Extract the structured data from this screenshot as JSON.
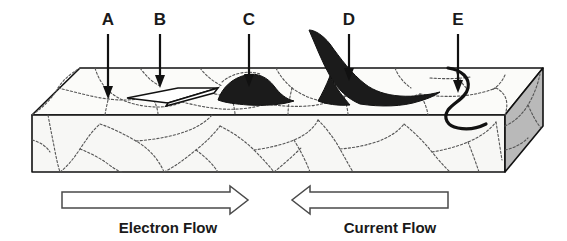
{
  "figure": {
    "title": "Metal slab cross-section with labeled defects and flow directions",
    "colors": {
      "ink": "#111111",
      "grain_boundary": "#555555",
      "top_face": "#fbfbf9",
      "front_face": "#f7f7f5",
      "side_face": "#b9b9b9",
      "defect_dark": "#1b1b1b",
      "defect_white": "#ffffff",
      "flow_arrow_outline": "#4a4a4a"
    }
  },
  "callouts": [
    {
      "id": "a",
      "label": "A",
      "label_x": 108,
      "label_y": 24,
      "arrow_x": 108,
      "arrow_top": 34,
      "arrow_bottom": 98
    },
    {
      "id": "b",
      "label": "B",
      "label_x": 160,
      "label_y": 24,
      "arrow_x": 160,
      "arrow_top": 34,
      "arrow_bottom": 84
    },
    {
      "id": "c",
      "label": "C",
      "label_x": 249,
      "label_y": 24,
      "arrow_x": 249,
      "arrow_top": 34,
      "arrow_bottom": 84
    },
    {
      "id": "d",
      "label": "D",
      "label_x": 349,
      "label_y": 24,
      "arrow_x": 349,
      "arrow_top": 34,
      "arrow_bottom": 80
    },
    {
      "id": "e",
      "label": "E",
      "label_x": 458,
      "label_y": 24,
      "arrow_x": 458,
      "arrow_top": 34,
      "arrow_bottom": 90
    }
  ],
  "flows": [
    {
      "id": "electron",
      "label": "Electron Flow",
      "label_x": 168,
      "label_y": 232,
      "direction": "right"
    },
    {
      "id": "current",
      "label": "Current Flow",
      "label_x": 390,
      "label_y": 232,
      "direction": "left"
    }
  ],
  "defects": [
    {
      "id": "a",
      "kind": "grain-interior",
      "description": "grain interior region"
    },
    {
      "id": "b",
      "kind": "white-facet",
      "description": "flat white facet / surface pit"
    },
    {
      "id": "c",
      "kind": "dark-mound",
      "description": "dark rounded deposit on surface"
    },
    {
      "id": "d",
      "kind": "dark-spike",
      "description": "dark flame-shaped whisker protrusion"
    },
    {
      "id": "e",
      "kind": "crack",
      "description": "serpentine crack through the slab surface"
    }
  ]
}
